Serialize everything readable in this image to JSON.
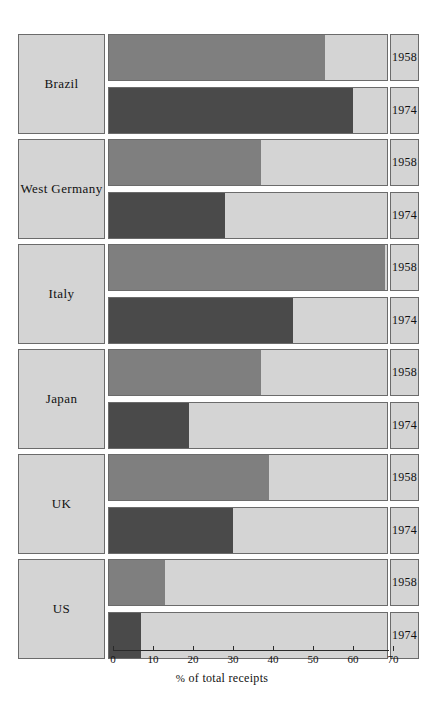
{
  "chart_data": {
    "type": "bar",
    "orientation": "horizontal",
    "title": "",
    "xlabel": "% of total receipts",
    "ylabel": "",
    "xlim": [
      0,
      70
    ],
    "xticks": [
      0,
      10,
      20,
      30,
      40,
      50,
      60,
      70
    ],
    "xtick_labels": [
      "0",
      "10",
      "20",
      "30",
      "40",
      "50",
      "60",
      "70"
    ],
    "grid": false,
    "legend": "none",
    "categories": [
      "Brazil",
      "West Germany",
      "Italy",
      "Japan",
      "UK",
      "US"
    ],
    "series": [
      {
        "name": "1958",
        "values": [
          54,
          38,
          69,
          38,
          40,
          14
        ]
      },
      {
        "name": "1974",
        "values": [
          61,
          29,
          46,
          20,
          31,
          8
        ]
      }
    ],
    "colors": {
      "series_1958": "#7f7f7f",
      "series_1974": "#4a4a4a",
      "track_background": "#d4d4d4",
      "border": "#6b6b6b",
      "page_background": "#ffffff",
      "text": "#111111"
    },
    "groups": [
      {
        "label": "Brazil",
        "bars": [
          {
            "year": "1958",
            "value": 54,
            "color_key": "series_1958"
          },
          {
            "year": "1974",
            "value": 61,
            "color_key": "series_1974"
          }
        ]
      },
      {
        "label": "West Germany",
        "bars": [
          {
            "year": "1958",
            "value": 38,
            "color_key": "series_1958"
          },
          {
            "year": "1974",
            "value": 29,
            "color_key": "series_1974"
          }
        ]
      },
      {
        "label": "Italy",
        "bars": [
          {
            "year": "1958",
            "value": 69,
            "color_key": "series_1958"
          },
          {
            "year": "1974",
            "value": 46,
            "color_key": "series_1974"
          }
        ]
      },
      {
        "label": "Japan",
        "bars": [
          {
            "year": "1958",
            "value": 38,
            "color_key": "series_1958"
          },
          {
            "year": "1974",
            "value": 20,
            "color_key": "series_1974"
          }
        ]
      },
      {
        "label": "UK",
        "bars": [
          {
            "year": "1958",
            "value": 40,
            "color_key": "series_1958"
          },
          {
            "year": "1974",
            "value": 31,
            "color_key": "series_1974"
          }
        ]
      },
      {
        "label": "US",
        "bars": [
          {
            "year": "1958",
            "value": 14,
            "color_key": "series_1958"
          },
          {
            "year": "1974",
            "value": 8,
            "color_key": "series_1974"
          }
        ]
      }
    ]
  },
  "axis": {
    "title_symbol": "%",
    "title_rest": " of total receipts"
  }
}
